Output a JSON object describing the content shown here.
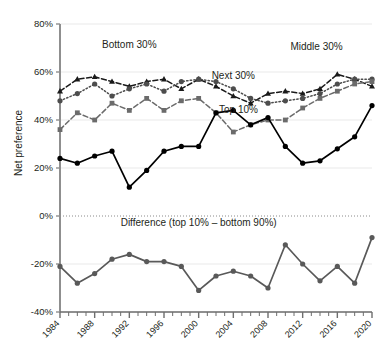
{
  "chart_data": {
    "type": "line",
    "title": "",
    "xlabel": "",
    "ylabel": "Net preference",
    "xlim": [
      1984,
      2020
    ],
    "ylim": [
      -40,
      80
    ],
    "ytick_labels": [
      "80%",
      "60%",
      "40%",
      "20%",
      "0%",
      "-20%",
      "-40%"
    ],
    "ytick_values": [
      80,
      60,
      40,
      20,
      0,
      -20,
      -40
    ],
    "xtick_labels": [
      "1984",
      "1988",
      "1992",
      "1996",
      "2000",
      "2004",
      "2008",
      "2012",
      "2016",
      "2020"
    ],
    "xtick_values": [
      1984,
      1988,
      1992,
      1996,
      2000,
      2004,
      2008,
      2012,
      2016,
      2020
    ],
    "minor_xticks_every": 1,
    "grid": "horizontal-light",
    "zero_line": true,
    "legend_position": "inline-annotations",
    "annotations": [
      {
        "id": "bottom30",
        "text": "Bottom 30%",
        "x": 1992.0,
        "y": 70
      },
      {
        "id": "middle30",
        "text": "Middle 30%",
        "x": 2013.6,
        "y": 69
      },
      {
        "id": "next30",
        "text": "Next 30%",
        "x": 2004.0,
        "y": 57
      },
      {
        "id": "top10",
        "text": "Top 10%",
        "x": 2004.6,
        "y": 43
      },
      {
        "id": "difference",
        "text": "Difference (top 10% – bottom 90%)",
        "x": 2000.0,
        "y": -4
      }
    ],
    "x": [
      1984,
      1986,
      1988,
      1990,
      1992,
      1994,
      1996,
      1998,
      2000,
      2002,
      2004,
      2006,
      2008,
      2010,
      2012,
      2014,
      2016,
      2018,
      2020
    ],
    "series": [
      {
        "name": "Bottom 30%",
        "style": "dashed",
        "marker": "triangle",
        "color": "#1a1a1a",
        "values": [
          52,
          57,
          58,
          56,
          54,
          56,
          57,
          53,
          57,
          54,
          50,
          47,
          51,
          52,
          51,
          53,
          59,
          57,
          54
        ]
      },
      {
        "name": "Middle 30%",
        "style": "dotted",
        "marker": "circle",
        "color": "#4d4d4d",
        "values": [
          48,
          51,
          55,
          50,
          53,
          55,
          52,
          56,
          57,
          56,
          53,
          49,
          47,
          48,
          49,
          51,
          55,
          57,
          57
        ]
      },
      {
        "name": "Next 30%",
        "style": "dashed",
        "marker": "square",
        "color": "#6b6b6b",
        "values": [
          36,
          43,
          40,
          47,
          44,
          49,
          44,
          48,
          49,
          43,
          35,
          38,
          40,
          40,
          45,
          49,
          52,
          55,
          56
        ]
      },
      {
        "name": "Top 10%",
        "style": "solid",
        "marker": "circle",
        "color": "#000000",
        "values": [
          24,
          22,
          25,
          27,
          12,
          19,
          27,
          29,
          29,
          43,
          44,
          38,
          41,
          29,
          22,
          23,
          28,
          33,
          46
        ]
      },
      {
        "name": "Difference (top 10% – bottom 90%)",
        "style": "solid",
        "marker": "circle",
        "color": "#595959",
        "values": [
          -21,
          -28,
          -24,
          -18,
          -16,
          -19,
          -19,
          -21,
          -31,
          -25,
          -23,
          -25,
          -30,
          -12,
          -20,
          -27,
          -21,
          -28,
          -9
        ]
      }
    ]
  }
}
